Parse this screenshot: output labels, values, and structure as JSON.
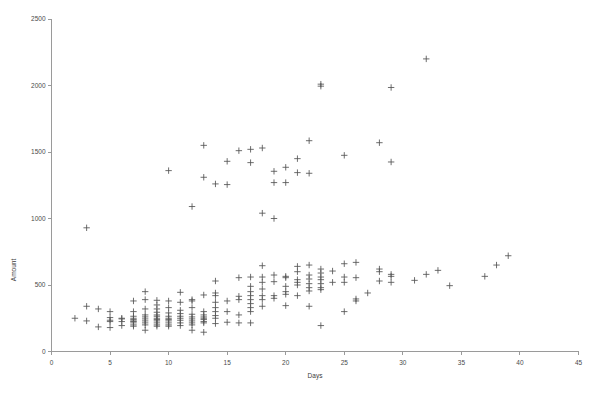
{
  "chart_data": {
    "type": "scatter",
    "title": "",
    "xlabel": "Days",
    "ylabel": "Amount",
    "xlim": [
      0,
      45
    ],
    "ylim": [
      0,
      2500
    ],
    "xticks": [
      0,
      5,
      10,
      15,
      20,
      25,
      30,
      35,
      40,
      45
    ],
    "yticks": [
      0,
      500,
      1000,
      1500,
      2000,
      2500
    ],
    "grid": false,
    "legend": null,
    "marker": "plus",
    "marker_color": "#545454",
    "series": [
      {
        "name": "observations",
        "points": [
          [
            2,
            250
          ],
          [
            3,
            930
          ],
          [
            3,
            340
          ],
          [
            3,
            230
          ],
          [
            4,
            320
          ],
          [
            4,
            185
          ],
          [
            5,
            300
          ],
          [
            5,
            255
          ],
          [
            5,
            235
          ],
          [
            5,
            225
          ],
          [
            5,
            180
          ],
          [
            6,
            250
          ],
          [
            6,
            245
          ],
          [
            6,
            225
          ],
          [
            6,
            195
          ],
          [
            7,
            380
          ],
          [
            7,
            300
          ],
          [
            7,
            265
          ],
          [
            7,
            250
          ],
          [
            7,
            240
          ],
          [
            7,
            230
          ],
          [
            7,
            225
          ],
          [
            7,
            215
          ],
          [
            7,
            200
          ],
          [
            7,
            190
          ],
          [
            8,
            450
          ],
          [
            8,
            390
          ],
          [
            8,
            320
          ],
          [
            8,
            275
          ],
          [
            8,
            260
          ],
          [
            8,
            245
          ],
          [
            8,
            230
          ],
          [
            8,
            215
          ],
          [
            8,
            200
          ],
          [
            8,
            160
          ],
          [
            9,
            385
          ],
          [
            9,
            350
          ],
          [
            9,
            320
          ],
          [
            9,
            295
          ],
          [
            9,
            275
          ],
          [
            9,
            265
          ],
          [
            9,
            250
          ],
          [
            9,
            240
          ],
          [
            9,
            230
          ],
          [
            9,
            215
          ],
          [
            9,
            200
          ],
          [
            9,
            190
          ],
          [
            10,
            1360
          ],
          [
            10,
            380
          ],
          [
            10,
            330
          ],
          [
            10,
            290
          ],
          [
            10,
            265
          ],
          [
            10,
            250
          ],
          [
            10,
            240
          ],
          [
            10,
            230
          ],
          [
            10,
            215
          ],
          [
            10,
            200
          ],
          [
            10,
            190
          ],
          [
            11,
            445
          ],
          [
            11,
            370
          ],
          [
            11,
            310
          ],
          [
            11,
            285
          ],
          [
            11,
            265
          ],
          [
            11,
            250
          ],
          [
            11,
            235
          ],
          [
            11,
            215
          ],
          [
            11,
            195
          ],
          [
            12,
            1090
          ],
          [
            12,
            390
          ],
          [
            12,
            380
          ],
          [
            12,
            330
          ],
          [
            12,
            280
          ],
          [
            12,
            260
          ],
          [
            12,
            245
          ],
          [
            12,
            230
          ],
          [
            12,
            215
          ],
          [
            12,
            200
          ],
          [
            12,
            160
          ],
          [
            13,
            1550
          ],
          [
            13,
            1310
          ],
          [
            13,
            425
          ],
          [
            13,
            300
          ],
          [
            13,
            275
          ],
          [
            13,
            260
          ],
          [
            13,
            250
          ],
          [
            13,
            240
          ],
          [
            13,
            225
          ],
          [
            13,
            215
          ],
          [
            13,
            145
          ],
          [
            14,
            1260
          ],
          [
            14,
            530
          ],
          [
            14,
            440
          ],
          [
            14,
            420
          ],
          [
            14,
            370
          ],
          [
            14,
            330
          ],
          [
            14,
            300
          ],
          [
            14,
            270
          ],
          [
            14,
            250
          ],
          [
            14,
            210
          ],
          [
            15,
            1430
          ],
          [
            15,
            1255
          ],
          [
            15,
            380
          ],
          [
            15,
            300
          ],
          [
            15,
            220
          ],
          [
            16,
            1510
          ],
          [
            16,
            555
          ],
          [
            16,
            415
          ],
          [
            16,
            390
          ],
          [
            16,
            275
          ],
          [
            16,
            215
          ],
          [
            17,
            1520
          ],
          [
            17,
            1420
          ],
          [
            17,
            560
          ],
          [
            17,
            490
          ],
          [
            17,
            450
          ],
          [
            17,
            420
          ],
          [
            17,
            390
          ],
          [
            17,
            360
          ],
          [
            17,
            330
          ],
          [
            17,
            300
          ],
          [
            17,
            215
          ],
          [
            18,
            1530
          ],
          [
            18,
            1040
          ],
          [
            18,
            645
          ],
          [
            18,
            560
          ],
          [
            18,
            520
          ],
          [
            18,
            470
          ],
          [
            18,
            420
          ],
          [
            18,
            390
          ],
          [
            18,
            340
          ],
          [
            19,
            1355
          ],
          [
            19,
            1270
          ],
          [
            19,
            1000
          ],
          [
            19,
            575
          ],
          [
            19,
            525
          ],
          [
            19,
            420
          ],
          [
            19,
            400
          ],
          [
            20,
            1385
          ],
          [
            20,
            1270
          ],
          [
            20,
            565
          ],
          [
            20,
            555
          ],
          [
            20,
            490
          ],
          [
            20,
            450
          ],
          [
            20,
            430
          ],
          [
            20,
            345
          ],
          [
            21,
            1450
          ],
          [
            21,
            1345
          ],
          [
            21,
            640
          ],
          [
            21,
            600
          ],
          [
            21,
            540
          ],
          [
            21,
            520
          ],
          [
            21,
            500
          ],
          [
            21,
            420
          ],
          [
            22,
            1585
          ],
          [
            22,
            1340
          ],
          [
            22,
            650
          ],
          [
            22,
            575
          ],
          [
            22,
            545
          ],
          [
            22,
            510
          ],
          [
            22,
            480
          ],
          [
            22,
            455
          ],
          [
            22,
            340
          ],
          [
            23,
            2010
          ],
          [
            23,
            1995
          ],
          [
            23,
            620
          ],
          [
            23,
            590
          ],
          [
            23,
            560
          ],
          [
            23,
            540
          ],
          [
            23,
            510
          ],
          [
            23,
            480
          ],
          [
            23,
            465
          ],
          [
            23,
            195
          ],
          [
            24,
            605
          ],
          [
            24,
            520
          ],
          [
            25,
            1475
          ],
          [
            25,
            660
          ],
          [
            25,
            560
          ],
          [
            25,
            520
          ],
          [
            25,
            300
          ],
          [
            26,
            670
          ],
          [
            26,
            555
          ],
          [
            26,
            395
          ],
          [
            26,
            380
          ],
          [
            27,
            440
          ],
          [
            28,
            1570
          ],
          [
            28,
            620
          ],
          [
            28,
            600
          ],
          [
            28,
            530
          ],
          [
            29,
            1985
          ],
          [
            29,
            1425
          ],
          [
            29,
            580
          ],
          [
            29,
            565
          ],
          [
            29,
            520
          ],
          [
            31,
            535
          ],
          [
            32,
            2200
          ],
          [
            32,
            580
          ],
          [
            33,
            610
          ],
          [
            34,
            495
          ],
          [
            37,
            565
          ],
          [
            38,
            650
          ],
          [
            39,
            720
          ]
        ]
      }
    ]
  },
  "axes": {
    "y_title": "Amount",
    "x_title": "Days",
    "y_tick_labels": [
      "0",
      "500",
      "1000",
      "1500",
      "2000",
      "2500"
    ],
    "x_tick_labels": [
      "0",
      "5",
      "10",
      "15",
      "20",
      "25",
      "30",
      "35",
      "40",
      "45"
    ]
  },
  "colors": {
    "axis": "#9a9a9a",
    "marker": "#545454",
    "text": "#3c3c3c",
    "background": "#ffffff"
  }
}
